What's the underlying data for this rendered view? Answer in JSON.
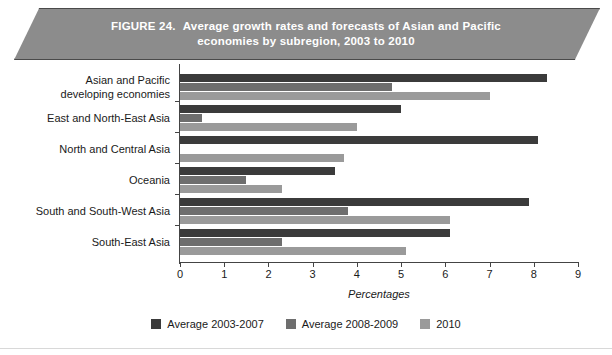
{
  "figure": {
    "number_label": "FIGURE 24.",
    "title_line1": "Average growth rates and forecasts of Asian and Pacific",
    "title_line2": "economies by subregion, 2003 to 2010",
    "banner_color": "#8c8c8c"
  },
  "chart_data": {
    "type": "bar",
    "orientation": "horizontal",
    "title": "Average growth rates and forecasts of Asian and Pacific economies by subregion, 2003 to 2010",
    "xlabel": "Percentages",
    "ylabel": "",
    "xlim": [
      0,
      9
    ],
    "xticks": [
      0,
      1,
      2,
      3,
      4,
      5,
      6,
      7,
      8,
      9
    ],
    "grid": false,
    "legend_position": "bottom",
    "categories": [
      "Asian and Pacific developing economies",
      "East and North-East Asia",
      "North and Central Asia",
      "Oceania",
      "South and South-West Asia",
      "South-East Asia"
    ],
    "category_lines": [
      [
        "Asian and Pacific",
        "developing economies"
      ],
      [
        "East and North-East Asia"
      ],
      [
        "North and Central Asia"
      ],
      [
        "Oceania"
      ],
      [
        "South and South-West Asia"
      ],
      [
        "South-East Asia"
      ]
    ],
    "series": [
      {
        "name": "Average  2003-2007",
        "color": "#3b3b3b",
        "values": [
          8.3,
          5.0,
          8.1,
          3.5,
          7.9,
          6.1
        ]
      },
      {
        "name": "Average  2008-2009",
        "color": "#6e6e6e",
        "values": [
          4.8,
          0.5,
          0.0,
          1.5,
          3.8,
          2.3
        ]
      },
      {
        "name": "2010",
        "color": "#9a9a9a",
        "values": [
          7.0,
          4.0,
          3.7,
          2.3,
          6.1,
          5.1
        ]
      }
    ]
  },
  "legend": {
    "items": [
      {
        "label": "Average  2003-2007",
        "color": "#3b3b3b"
      },
      {
        "label": "Average  2008-2009",
        "color": "#6e6e6e"
      },
      {
        "label": "2010",
        "color": "#9a9a9a"
      }
    ]
  }
}
